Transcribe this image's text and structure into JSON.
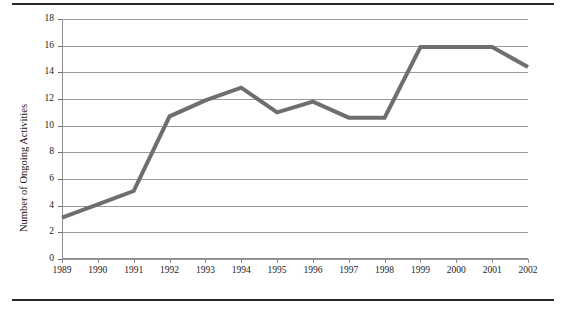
{
  "chart_data": {
    "type": "line",
    "title": "",
    "subtitle": "",
    "xlabel": "",
    "ylabel": "Number of Ongoing Activities",
    "categories": [
      "1989",
      "1990",
      "1991",
      "1992",
      "1993",
      "1994",
      "1995",
      "1996",
      "1997",
      "1998",
      "1999",
      "2000",
      "2001",
      "2002"
    ],
    "x": [
      1989,
      1990,
      1991,
      1992,
      1993,
      1994,
      1995,
      1996,
      1997,
      1998,
      1999,
      2000,
      2001,
      2002
    ],
    "values": [
      3.1,
      4.1,
      5.1,
      10.7,
      11.9,
      12.85,
      11.0,
      11.8,
      10.6,
      10.6,
      15.9,
      15.9,
      15.9,
      14.4
    ],
    "series": [
      {
        "name": "Ongoing Activities",
        "color": "#6e6e6e",
        "values": [
          3.1,
          4.1,
          5.1,
          10.7,
          11.9,
          12.85,
          11.0,
          11.8,
          10.6,
          10.6,
          15.9,
          15.9,
          15.9,
          14.4
        ]
      }
    ],
    "ylim": [
      0,
      18
    ],
    "yticks": [
      0,
      2,
      4,
      6,
      8,
      10,
      12,
      14,
      16,
      18
    ],
    "ytick_labels": [
      "0",
      "2",
      "4",
      "6",
      "8",
      "10",
      "12",
      "14",
      "16",
      "18"
    ],
    "xlim": [
      1989,
      2002
    ],
    "grid": "horizontal",
    "grid_color": "#9a9a9a",
    "legend": "none",
    "line_width_px": 4,
    "markers": "none",
    "background": "#ffffff",
    "frame": {
      "top_rule": true,
      "bottom_rule": true,
      "rule_color": "#2b2b2b"
    }
  }
}
